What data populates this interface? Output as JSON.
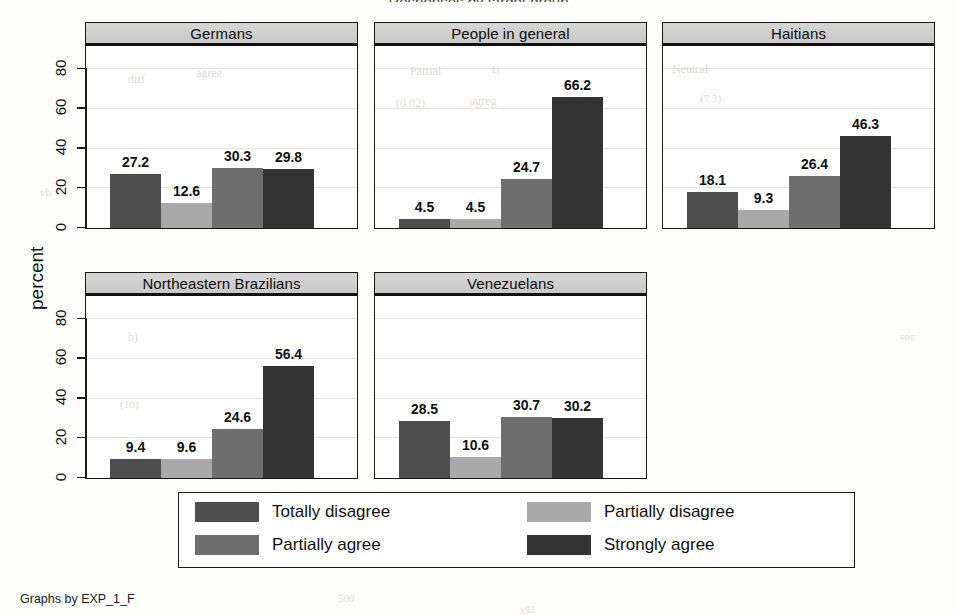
{
  "figure": {
    "suptitle": "Responses by target group",
    "ylabel": "percent",
    "footnote": "Graphs by EXP_1_F"
  },
  "axis": {
    "ticks": [
      "0",
      "20",
      "40",
      "60",
      "80"
    ],
    "tickvalues": [
      0,
      20,
      40,
      60,
      80
    ]
  },
  "legend": {
    "items": [
      {
        "label": "Totally disagree",
        "color": "#4d4d4d"
      },
      {
        "label": "Partially disagree",
        "color": "#a9a9a9"
      },
      {
        "label": "Partially agree",
        "color": "#6e6e6e"
      },
      {
        "label": "Strongly agree",
        "color": "#333333"
      }
    ]
  },
  "chart_data": {
    "type": "bar",
    "title": "Responses by target group",
    "xlabel": "",
    "ylabel": "percent",
    "ylim": [
      0,
      92
    ],
    "yticks": [
      0,
      20,
      40,
      60,
      80
    ],
    "grid": true,
    "legend_position": "bottom",
    "categories": [
      "Totally disagree",
      "Partially disagree",
      "Partially agree",
      "Strongly agree"
    ],
    "colors": [
      "#4d4d4d",
      "#a9a9a9",
      "#6e6e6e",
      "#333333"
    ],
    "panels": [
      {
        "name": "Germans",
        "values": [
          27.2,
          12.6,
          30.3,
          29.8
        ],
        "labels": [
          "27.2",
          "12.6",
          "30.3",
          "29.8"
        ]
      },
      {
        "name": "People in general",
        "values": [
          4.5,
          4.5,
          24.7,
          66.2
        ],
        "labels": [
          "4.5",
          "4.5",
          "24.7",
          "66.2"
        ]
      },
      {
        "name": "Haitians",
        "values": [
          18.1,
          9.3,
          26.4,
          46.3
        ],
        "labels": [
          "18.1",
          "9.3",
          "26.4",
          "46.3"
        ]
      },
      {
        "name": "Northeastern Brazilians",
        "values": [
          9.4,
          9.6,
          24.6,
          56.4
        ],
        "labels": [
          "9.4",
          "9.6",
          "24.6",
          "56.4"
        ]
      },
      {
        "name": "Venezuelans",
        "values": [
          28.5,
          10.6,
          30.7,
          30.2
        ],
        "labels": [
          "28.5",
          "10.6",
          "30.7",
          "30.2"
        ]
      }
    ]
  },
  "ghosts": [
    {
      "t": "diff",
      "x": 128,
      "y": 72,
      "s": 12
    },
    {
      "t": "agree",
      "x": 196,
      "y": 66,
      "s": 12
    },
    {
      "t": "Partial",
      "x": 410,
      "y": 64,
      "s": 12
    },
    {
      "t": "t)",
      "x": 492,
      "y": 62,
      "s": 12
    },
    {
      "t": "Neutral",
      "x": 672,
      "y": 62,
      "s": 12
    },
    {
      "t": "(0.02)",
      "x": 396,
      "y": 96,
      "s": 12
    },
    {
      "t": "agreg",
      "x": 470,
      "y": 94,
      "s": 12
    },
    {
      "t": "(7.3)",
      "x": 700,
      "y": 92,
      "s": 11
    },
    {
      "t": "b)",
      "x": 128,
      "y": 330,
      "s": 12
    },
    {
      "t": "(10)",
      "x": 120,
      "y": 398,
      "s": 11
    },
    {
      "t": "soc",
      "x": 900,
      "y": 330,
      "s": 11
    },
    {
      "t": "vb",
      "x": 40,
      "y": 186,
      "s": 11
    },
    {
      "t": "500",
      "x": 338,
      "y": 592,
      "s": 11
    },
    {
      "t": "g82",
      "x": 520,
      "y": 604,
      "s": 10
    }
  ]
}
